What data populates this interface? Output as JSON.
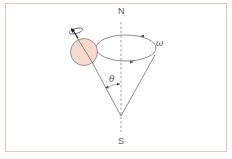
{
  "diagram": {
    "labels": {
      "north": "N",
      "south": "S",
      "omega": "ω",
      "theta": "θ"
    },
    "colors": {
      "frame": "#e8c4c0",
      "line": "#707070",
      "axis": "#8a8a8a",
      "sphere_fill": "#f6d9cf",
      "sphere_stroke": "#8a7a76",
      "text": "#555555"
    },
    "elements": [
      "vertical dashed axis N-S",
      "precession cone with apex on axis",
      "elliptical precession orbit with direction arrows",
      "spinning sphere (nucleus) at cone rim",
      "spin rotation arrow on sphere",
      "angle theta between cone and axis"
    ]
  }
}
